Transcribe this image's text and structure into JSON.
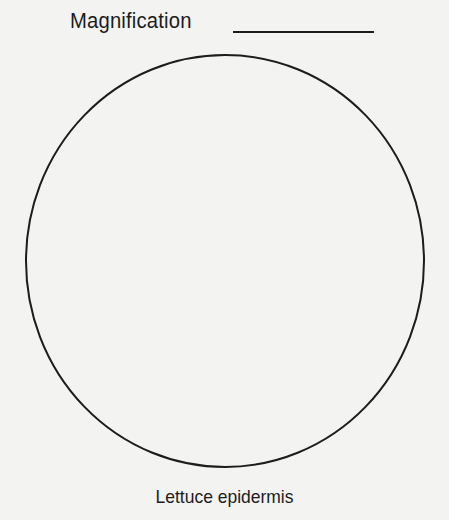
{
  "worksheet": {
    "title": "Magnification",
    "answer_blank": "",
    "caption": "Lettuce epidermis"
  },
  "colors": {
    "paper": "#f3f3f2",
    "ink": "#1c1c1c"
  }
}
